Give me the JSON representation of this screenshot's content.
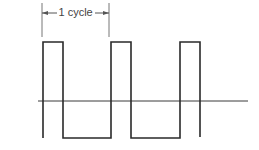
{
  "diagram": {
    "cycle_annotation": {
      "label": "1 cycle",
      "x_start": 42,
      "x_end": 109,
      "arrow_y": 13,
      "tick_top": 3,
      "tick_bottom": 37
    },
    "baseline": {
      "y": 101,
      "x_start": 38,
      "x_end": 248
    },
    "waveform": {
      "high_y": 42,
      "low_y": 138,
      "start_x": 43,
      "start_y": 138,
      "points": [
        [
          43,
          138
        ],
        [
          43,
          42
        ],
        [
          63,
          42
        ],
        [
          63,
          138
        ],
        [
          111,
          138
        ],
        [
          111,
          42
        ],
        [
          131,
          42
        ],
        [
          131,
          138
        ],
        [
          180,
          138
        ],
        [
          180,
          42
        ],
        [
          200,
          42
        ],
        [
          200,
          137
        ]
      ]
    },
    "colors": {
      "stroke": "#2a2a2a",
      "annotation": "#555555",
      "background": "#ffffff"
    }
  }
}
